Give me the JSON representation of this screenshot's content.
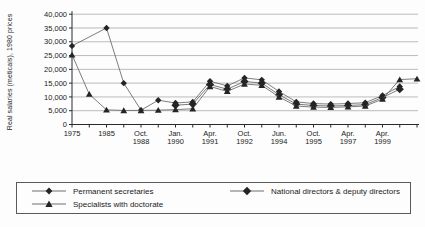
{
  "figure_title": "",
  "chart_data": {
    "type": "line",
    "title": "",
    "xlabel": "",
    "ylabel": "Real salaries (meticais), 1980 prices",
    "ylim": [
      0,
      40000
    ],
    "ytick_step": 5000,
    "ytick_labels": [
      "0",
      "5,000",
      "10,000",
      "15,000",
      "20,000",
      "25,000",
      "30,000",
      "35,000",
      "40,000"
    ],
    "grid": true,
    "legend_position": "bottom-box",
    "categories": [
      "1975",
      "",
      "1985",
      "",
      "Oct.|1988",
      "",
      "Jan.|1990",
      "",
      "Apr.|1991",
      "",
      "Oct.|1992",
      "",
      "Jun.|1994",
      "",
      "Oct.|1995",
      "",
      "Apr.|1997",
      "",
      "Apr.|1999",
      "",
      ""
    ],
    "series": [
      {
        "name": "Permanent secretaries",
        "marker": "diamond-small",
        "values": [
          28500,
          null,
          35000,
          15000,
          5200,
          8800,
          7800,
          8200,
          15700,
          14000,
          16900,
          16200,
          12000,
          8200,
          7600,
          7400,
          7600,
          7900,
          10500,
          13800,
          null
        ]
      },
      {
        "name": "National directors & deputy directors",
        "marker": "diamond-large",
        "values": [
          null,
          null,
          null,
          null,
          null,
          null,
          7000,
          7400,
          14500,
          12800,
          15600,
          15000,
          10800,
          7400,
          6900,
          6700,
          6900,
          7200,
          9800,
          12800,
          null
        ]
      },
      {
        "name": "Specialists with doctorate",
        "marker": "triangle",
        "values": [
          25300,
          11000,
          5300,
          5100,
          5100,
          5200,
          5400,
          5700,
          13800,
          12000,
          14700,
          14200,
          10000,
          6700,
          6300,
          6200,
          6400,
          6700,
          9200,
          16300,
          16600
        ]
      }
    ]
  },
  "colors": {
    "background": "#fdfdfd",
    "axis": "#2a2a2a",
    "grid": "#8f8f8f",
    "line": "#6e6e6e",
    "marker": "#242424",
    "text": "#1b1b1b",
    "legend_border": "#5a5a5a"
  }
}
